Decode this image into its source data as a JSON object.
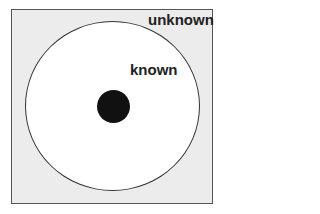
{
  "diagram": {
    "outer_region_label": "unknown",
    "inner_region_label": "known",
    "colors": {
      "outer_fill": "#ececec",
      "inner_fill": "#ffffff",
      "center_dot": "#111111",
      "stroke": "#333333"
    }
  }
}
